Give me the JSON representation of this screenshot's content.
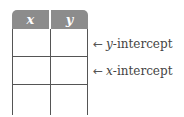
{
  "table": {
    "headers": [
      "x",
      "y"
    ],
    "rows": [
      [
        "",
        ""
      ],
      [
        "",
        ""
      ],
      [
        "",
        ""
      ]
    ],
    "header_color": "#8c8c8c"
  },
  "annotations": [
    {
      "arrow": "←",
      "variable": "y",
      "suffix": "-intercept",
      "row_index": 0
    },
    {
      "arrow": "←",
      "variable": "x",
      "suffix": "-intercept",
      "row_index": 1
    }
  ]
}
